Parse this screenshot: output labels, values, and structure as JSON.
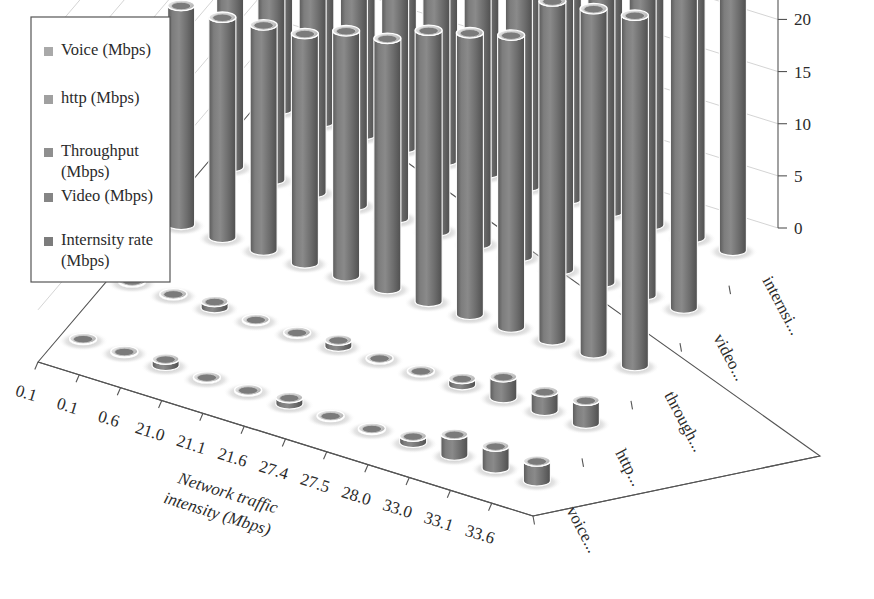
{
  "figure": {
    "title": "",
    "background_color": "#ffffff",
    "bar_color": "#6f6f6f",
    "bar_top_color": "#d8d8d8",
    "grid_color": "#cfcfcf",
    "axis_color": "#555555",
    "text_color": "#2b2b2b"
  },
  "legend": {
    "position": "top-left",
    "items": [
      {
        "label": "Voice (Mbps)",
        "swatch_color": "#a9a9a9"
      },
      {
        "label": "http (Mbps)",
        "swatch_color": "#a0a0a0"
      },
      {
        "label": "Throughput (Mbps)",
        "swatch_color": "#8f8f8f"
      },
      {
        "label": "Video (Mbps)",
        "swatch_color": "#858585"
      },
      {
        "label": "Internsity rate (Mbps)",
        "swatch_color": "#7c7c7c"
      }
    ]
  },
  "chart_data": {
    "type": "bar",
    "subtype": "3d-cylinder",
    "title": "",
    "xlabel": "Network traffic intensity (Mbps)",
    "ylabel": "",
    "zlabel": "",
    "zlim": [
      0,
      35
    ],
    "ztick_values": [
      0,
      5,
      10,
      15,
      20,
      25,
      30,
      35
    ],
    "ztick_labels": [
      "0",
      "5",
      "10",
      "15",
      "20",
      "25",
      "30",
      "35"
    ],
    "grid": true,
    "legend_position": "top-left",
    "categories": [
      "0.1",
      "0.1",
      "0.6",
      "21.0",
      "21.1",
      "21.6",
      "27.4",
      "27.5",
      "28.0",
      "33.0",
      "33.1",
      "33.6"
    ],
    "series_labels": [
      "voice...",
      "http...",
      "through...",
      "video...",
      "internsi..."
    ],
    "series": [
      {
        "name": "Voice (Mbps)",
        "values": [
          0.1,
          0.1,
          0.6,
          0.1,
          0.1,
          0.6,
          0.1,
          0.1,
          0.6,
          2.0,
          2.1,
          1.9
        ]
      },
      {
        "name": "http (Mbps)",
        "values": [
          0.1,
          0.1,
          0.6,
          0.1,
          0.1,
          0.6,
          0.1,
          0.1,
          0.6,
          2.0,
          1.8,
          2.2
        ]
      },
      {
        "name": "Throughput (Mbps)",
        "values": [
          21.0,
          21.1,
          21.6,
          22.0,
          23.5,
          24.0,
          26.0,
          27.0,
          28.0,
          32.5,
          33.0,
          33.6
        ]
      },
      {
        "name": "Video (Mbps)",
        "values": [
          21.0,
          21.1,
          21.6,
          22.5,
          23.0,
          25.5,
          26.5,
          27.5,
          29.0,
          32.0,
          33.1,
          33.0
        ]
      },
      {
        "name": "Internsity rate (Mbps)",
        "values": [
          21.0,
          21.1,
          21.6,
          23.0,
          24.5,
          25.0,
          27.4,
          27.5,
          28.0,
          33.0,
          33.1,
          33.6
        ]
      }
    ]
  }
}
